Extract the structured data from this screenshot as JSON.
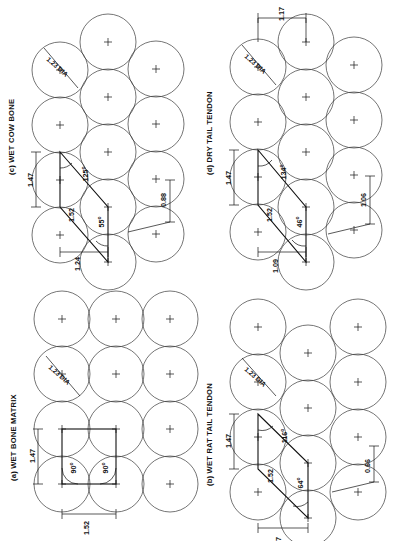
{
  "figure": {
    "orientation": "rotated-90",
    "background_color": "#ffffff",
    "line_color": "#111111",
    "circle_color": "#3a3a3a",
    "diameter_callout": "1.23 DIA"
  },
  "panels": [
    {
      "id": "a",
      "title": "(a) WET BONE MATRIX",
      "lattice": "square",
      "dim_side_a": "1.47",
      "dim_side_b": "1.52",
      "angle_1": "90",
      "angle_2": "90",
      "dia_label": "1.23 DIA",
      "extra_dims": []
    },
    {
      "id": "b",
      "title": "(b) WET RAT TAIL TENDON",
      "lattice": "oblique",
      "dim_side_a": "1.47",
      "dim_side_b": "1.52",
      "angle_1": "116",
      "angle_2": "64",
      "dia_label": "1.23 DIA",
      "extra_dims": [
        "0.66",
        "37"
      ]
    },
    {
      "id": "c",
      "title": "(c)  WET COW BONE",
      "lattice": "oblique",
      "dim_side_a": "1.47",
      "dim_side_b": "1.52",
      "angle_1": "125",
      "angle_2": "55",
      "dia_label": "1.23 DIA",
      "extra_dims": [
        "1.24",
        "0.88"
      ]
    },
    {
      "id": "d",
      "title": "(d)  DRY TAIL TENDON",
      "lattice": "oblique",
      "dim_side_a": "1.47",
      "dim_side_b": "1.52",
      "angle_1": "134",
      "angle_2": "46",
      "dia_label": "1.23 DIA",
      "extra_dims": [
        "1.09",
        "1.06",
        "1.17"
      ]
    }
  ],
  "degree_symbol": "o"
}
